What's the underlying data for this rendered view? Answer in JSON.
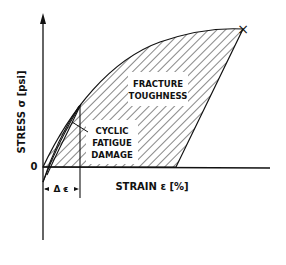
{
  "diagram": {
    "type": "stress-strain curve",
    "y_axis_label": "STRESS σ [psi]",
    "x_axis_label": "STRAIN ε [%]",
    "origin_label": "0",
    "regions": {
      "fracture_toughness": [
        "FRACTURE",
        "TOUGHNESS"
      ],
      "cyclic_fatigue": [
        "CYCLIC",
        "FATIGUE",
        "DAMAGE"
      ]
    },
    "delta_label": "Δ ε",
    "fracture_marker": "×",
    "colors": {
      "ink": "#111111",
      "background": "#ffffff"
    }
  }
}
